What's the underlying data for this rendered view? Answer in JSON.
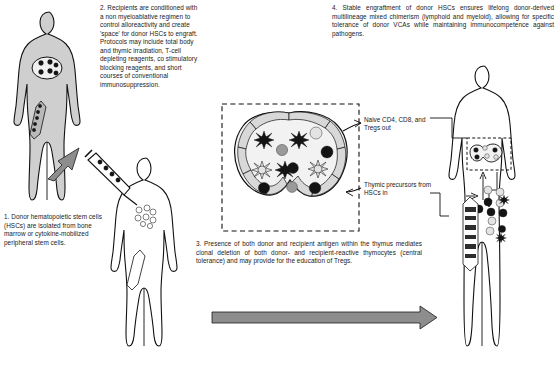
{
  "figure": {
    "type": "scientific-schematic"
  },
  "steps": [
    {
      "id": "step1",
      "number": "1.",
      "text": "1. Donor hematopoietic stem cells (HSCs) are isolated from bone marrow or cytokine-mobilized peripheral stem cells."
    },
    {
      "id": "step2",
      "number": "2.",
      "text": "2. Recipients are conditioned with a non myeloablative regimen to control alloreactivity and create 'space' for donor HSCs to engraft. Protocols may include total body and thymic irradiation, T-cell depleting reagents, co stimulatory blocking reagents, and short courses of conventional immunosuppression."
    },
    {
      "id": "step3",
      "number": "3.",
      "text": "3. Presence of both donor and recipient antigen within the thymus mediates clonal deletion of both donor- and recipient-reactive thymocytes (central tolerance) and may provide for the education of Tregs."
    },
    {
      "id": "step4",
      "number": "4.",
      "text": "4.    Stable engraftment of donor HSCs ensures lifelong donor-derived multilineage mixed chimerism (lymphoid and myeloid), allowing for specific tolerance of donor VCAs while maintaining immunocompetence against pathogens."
    }
  ],
  "callouts": [
    {
      "id": "naive-out",
      "text": "Naive CD4, CD8, and Tregs out"
    },
    {
      "id": "thymic-precursors-in",
      "text": "Thymic precursors from HSCs in"
    }
  ],
  "figures": [
    {
      "id": "donor-body",
      "role": "donor",
      "shading": "gray",
      "elements": [
        "bone-marrow-chest",
        "femur-bone",
        "dark-stem-cells"
      ]
    },
    {
      "id": "recipient-body",
      "role": "recipient-conditioned",
      "shading": "white",
      "elements": [
        "syringe-injection",
        "open-cells-chest",
        "femur-bone"
      ]
    },
    {
      "id": "chimeric-body",
      "role": "chimeric-recipient",
      "shading": "white",
      "elements": [
        "thymus-inset",
        "mixed-cells",
        "marrow-bone",
        "dashed-callout-box"
      ]
    }
  ],
  "thymus": {
    "id": "thymus-detail",
    "cortex_label": "thymic cortex",
    "cell_types": [
      "dendritic-cell-dark",
      "dendritic-cell-light",
      "thymocyte-dark",
      "thymocyte-mid",
      "thymocyte-light"
    ],
    "dendritic_cells": 6,
    "round_cells": 9
  },
  "colors": {
    "body_gray": "#cfcfcf",
    "body_white": "#ffffff",
    "outline": "#111111",
    "cell_dark": "#141414",
    "cell_mid": "#9a9a9a",
    "cell_light": "#e3e3e3",
    "arrow_gray": "#8d8d8d"
  },
  "arrows": {
    "timeline_label": "",
    "donor_to_recipient": "diagonal-gray-arrow",
    "timeline": "long-horizontal-gray-arrow"
  }
}
